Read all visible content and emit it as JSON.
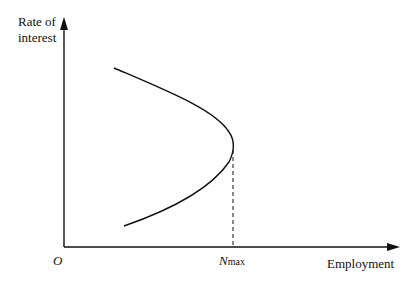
{
  "diagram": {
    "type": "economics-curve",
    "y_axis_label_line1": "Rate of",
    "y_axis_label_line2": "interest",
    "x_axis_label": "Employment",
    "origin_label": "O",
    "nmax_label_main": "N",
    "nmax_label_sub": "max",
    "curve": {
      "description": "Backward-bending curve: employment rises with interest rate up to N_max, then bends back",
      "points_px": [
        [
          114,
          68
        ],
        [
          233,
          148
        ],
        [
          124,
          226
        ]
      ]
    },
    "colors": {
      "line": "#111111",
      "background": "#ffffff"
    }
  }
}
